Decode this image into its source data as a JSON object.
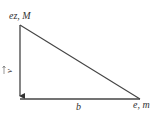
{
  "diagram": {
    "type": "right-triangle",
    "labels": {
      "top_vertex": "ez, M",
      "right_vertex": "e, m",
      "bottom_side": "b",
      "left_side_vector": "v"
    },
    "colors": {
      "line": "#444444",
      "text": "#333333",
      "background": "#ffffff"
    }
  }
}
